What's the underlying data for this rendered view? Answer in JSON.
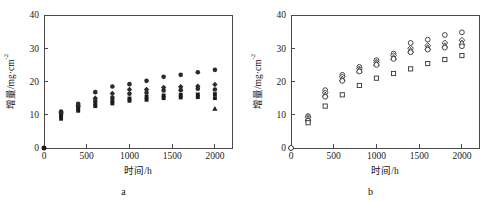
{
  "figure": {
    "panels": [
      {
        "id": "a",
        "caption": "a"
      },
      {
        "id": "b",
        "caption": "b"
      }
    ]
  },
  "chart_data": [
    {
      "type": "scatter",
      "panel": "a",
      "title": "",
      "xlabel": "时间/h",
      "ylabel": "增量/mg·cm",
      "ylabel_sup": "-2",
      "xlim": [
        0,
        2200
      ],
      "ylim": [
        0,
        40
      ],
      "xticks": [
        0,
        500,
        1000,
        1500,
        2000
      ],
      "yticks": [
        0,
        10,
        20,
        30,
        40
      ],
      "xticklabels": [
        "0",
        "500",
        "1000",
        "1500",
        "2000"
      ],
      "yticklabels": [
        "0",
        "10",
        "20",
        "30",
        "40"
      ],
      "grid": false,
      "legend": "none",
      "marker_style": "filled",
      "series": [
        {
          "name": "S1",
          "marker": "circle",
          "x": [
            0,
            200,
            400,
            600,
            800,
            1000,
            1200,
            1400,
            1600,
            1800,
            2000
          ],
          "values": [
            0.0,
            11.0,
            13.3,
            16.8,
            18.5,
            19.2,
            20.2,
            21.4,
            22.0,
            22.8,
            23.5
          ]
        },
        {
          "name": "S2",
          "marker": "diamond",
          "x": [
            0,
            200,
            400,
            600,
            800,
            1000,
            1200,
            1400,
            1600,
            1800,
            2000
          ],
          "values": [
            0.0,
            10.6,
            12.8,
            15.0,
            16.4,
            17.6,
            17.6,
            18.2,
            18.4,
            18.6,
            19.1
          ]
        },
        {
          "name": "S3",
          "marker": "circle",
          "x": [
            0,
            200,
            400,
            600,
            800,
            1000,
            1200,
            1400,
            1600,
            1800,
            2000
          ],
          "values": [
            0.0,
            10.2,
            12.4,
            14.2,
            15.2,
            16.3,
            16.6,
            17.3,
            17.4,
            17.8,
            17.6
          ]
        },
        {
          "name": "S4",
          "marker": "square",
          "x": [
            0,
            200,
            400,
            600,
            800,
            1000,
            1200,
            1400,
            1600,
            1800,
            2000
          ],
          "values": [
            0.0,
            9.6,
            11.9,
            13.4,
            14.2,
            14.9,
            15.4,
            15.8,
            16.0,
            16.1,
            16.2
          ]
        },
        {
          "name": "S5",
          "marker": "square",
          "x": [
            0,
            200,
            400,
            600,
            800,
            1000,
            1200,
            1400,
            1600,
            1800,
            2000
          ],
          "values": [
            0.0,
            8.8,
            11.2,
            12.6,
            13.4,
            14.2,
            14.5,
            15.0,
            15.2,
            15.3,
            15.0
          ]
        },
        {
          "name": "S6",
          "marker": "triangle",
          "x": [
            2000
          ],
          "values": [
            11.8
          ]
        }
      ]
    },
    {
      "type": "scatter",
      "panel": "b",
      "title": "",
      "xlabel": "时间/h",
      "ylabel": "增量/mg·cm",
      "ylabel_sup": "-2",
      "xlim": [
        0,
        2200
      ],
      "ylim": [
        0,
        40
      ],
      "xticks": [
        0,
        500,
        1000,
        1500,
        2000
      ],
      "yticks": [
        0,
        10,
        20,
        30,
        40
      ],
      "xticklabels": [
        "0",
        "500",
        "1000",
        "1500",
        "2000"
      ],
      "yticklabels": [
        "0",
        "10",
        "20",
        "30",
        "40"
      ],
      "grid": false,
      "legend": "none",
      "marker_style": "open",
      "series": [
        {
          "name": "S1",
          "marker": "circle",
          "x": [
            0,
            200,
            400,
            600,
            800,
            1000,
            1200,
            1400,
            1600,
            1800,
            2000
          ],
          "values": [
            0.0,
            9.6,
            17.4,
            22.0,
            24.4,
            26.4,
            28.4,
            31.6,
            32.6,
            34.0,
            34.8
          ]
        },
        {
          "name": "S2",
          "marker": "diamond",
          "x": [
            0,
            200,
            400,
            600,
            800,
            1000,
            1200,
            1400,
            1600,
            1800,
            2000
          ],
          "values": [
            0.0,
            9.2,
            16.6,
            21.4,
            23.8,
            25.8,
            27.8,
            30.0,
            30.8,
            31.6,
            32.4
          ]
        },
        {
          "name": "S3",
          "marker": "triangle",
          "x": [
            200,
            400,
            600,
            800,
            1000,
            1200,
            1400,
            1600,
            1800,
            2000
          ],
          "values": [
            8.8,
            16.0,
            20.8,
            23.4,
            25.4,
            27.2,
            29.4,
            30.2,
            30.8,
            31.6
          ]
        },
        {
          "name": "S4",
          "marker": "circle",
          "x": [
            200,
            400,
            600,
            800,
            1000,
            1200,
            1400,
            1600,
            1800,
            2000
          ],
          "values": [
            8.2,
            15.4,
            20.2,
            23.0,
            25.0,
            26.8,
            28.8,
            29.6,
            30.2,
            30.6
          ]
        },
        {
          "name": "S5",
          "marker": "square",
          "x": [
            200,
            400,
            600,
            800,
            1000,
            1200,
            1400,
            1600,
            1800,
            2000
          ],
          "values": [
            7.6,
            12.6,
            16.0,
            18.8,
            21.0,
            22.4,
            23.8,
            25.4,
            26.6,
            27.8
          ]
        }
      ]
    }
  ]
}
